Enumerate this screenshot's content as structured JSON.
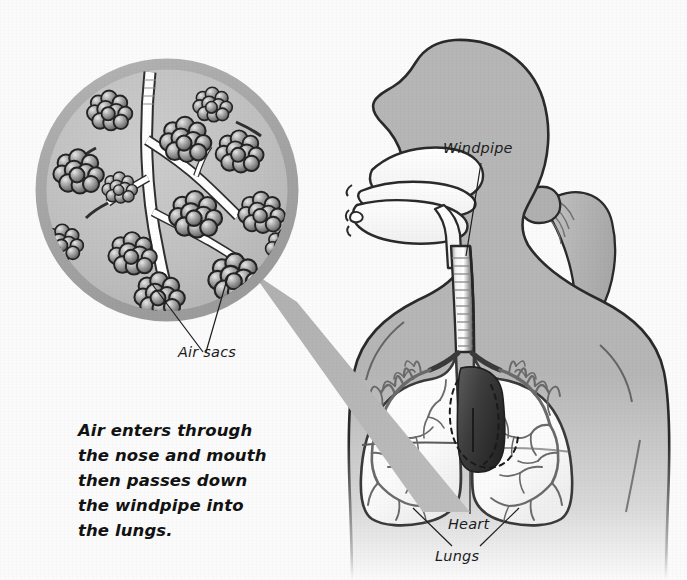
{
  "diagram": {
    "background_color": "#fbfbfb",
    "body_fill": "#b6b6b6",
    "outline_color": "#2a2a2a",
    "magnifier_ring_color": "#a9a9a9",
    "magnifier_field_color": "#bfbfbf",
    "heart_color": "#3a3a3a",
    "lung_fill": "#ffffff"
  },
  "caption": {
    "lines": [
      "Air enters through",
      "the nose and mouth",
      "then passes down",
      "the windpipe into",
      "the lungs."
    ]
  },
  "labels": {
    "windpipe": "Windpipe",
    "heart": "Heart",
    "lungs": "Lungs",
    "air_sacs": "Air sacs"
  },
  "callout": {
    "kind": "magnifier-circle",
    "shows": "Air sacs (alveoli) clustered on bronchiole branches",
    "alveoli_cluster_count": 13,
    "connector": "tapered gray band from magnifier to lungs"
  },
  "figure": {
    "pose": "head in left profile, upper torso front-facing",
    "hair": "ponytail on the right side of the head",
    "cutaway": "nasal cavity, oral cavity, tongue, throat and windpipe shown in white"
  },
  "anatomy_parts": [
    "nasal cavity",
    "mouth",
    "tongue",
    "throat",
    "windpipe",
    "bronchi",
    "bronchioles",
    "left lung",
    "right lung",
    "air sacs",
    "heart"
  ]
}
